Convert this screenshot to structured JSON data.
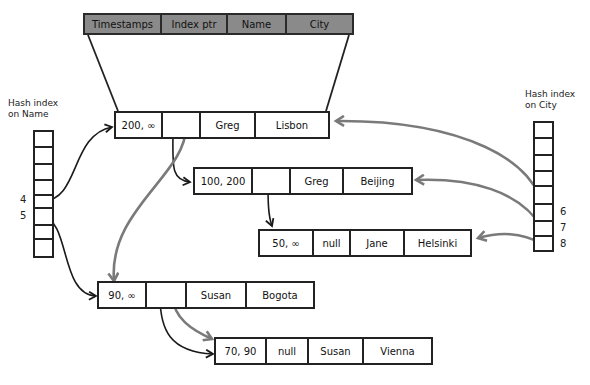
{
  "header": {
    "columns": [
      "Timestamps",
      "Index ptr",
      "Name",
      "City"
    ]
  },
  "hash_name": {
    "title_line1": "Hash index",
    "title_line2": "on Name",
    "slots": [
      {
        "label": "4",
        "target": "record-greg-lisbon"
      },
      {
        "label": "5",
        "target": "record-susan-bogota"
      }
    ]
  },
  "hash_city": {
    "title_line1": "Hash index",
    "title_line2": "on City",
    "slots": [
      {
        "label": "6",
        "target": "record-greg-lisbon"
      },
      {
        "label": "7",
        "target": "record-greg-beijing"
      },
      {
        "label": "8",
        "target": "record-jane-helsinki"
      }
    ]
  },
  "records": [
    {
      "id": "greg-lisbon",
      "timestamps": "200, ∞",
      "index_ptr": "",
      "name": "Greg",
      "city": "Lisbon"
    },
    {
      "id": "greg-beijing",
      "timestamps": "100, 200",
      "index_ptr": "",
      "name": "Greg",
      "city": "Beijing"
    },
    {
      "id": "jane-helsinki",
      "timestamps": "50, ∞",
      "index_ptr": "null",
      "name": "Jane",
      "city": "Helsinki"
    },
    {
      "id": "susan-bogota",
      "timestamps": "90, ∞",
      "index_ptr": "",
      "name": "Susan",
      "city": "Bogota"
    },
    {
      "id": "susan-vienna",
      "timestamps": "70, 90",
      "index_ptr": "null",
      "name": "Susan",
      "city": "Vienna"
    }
  ],
  "colors": {
    "name_pointer": "#1a1a1a",
    "city_pointer": "#7a7a7a",
    "header_fill": "#8a8a8a"
  }
}
